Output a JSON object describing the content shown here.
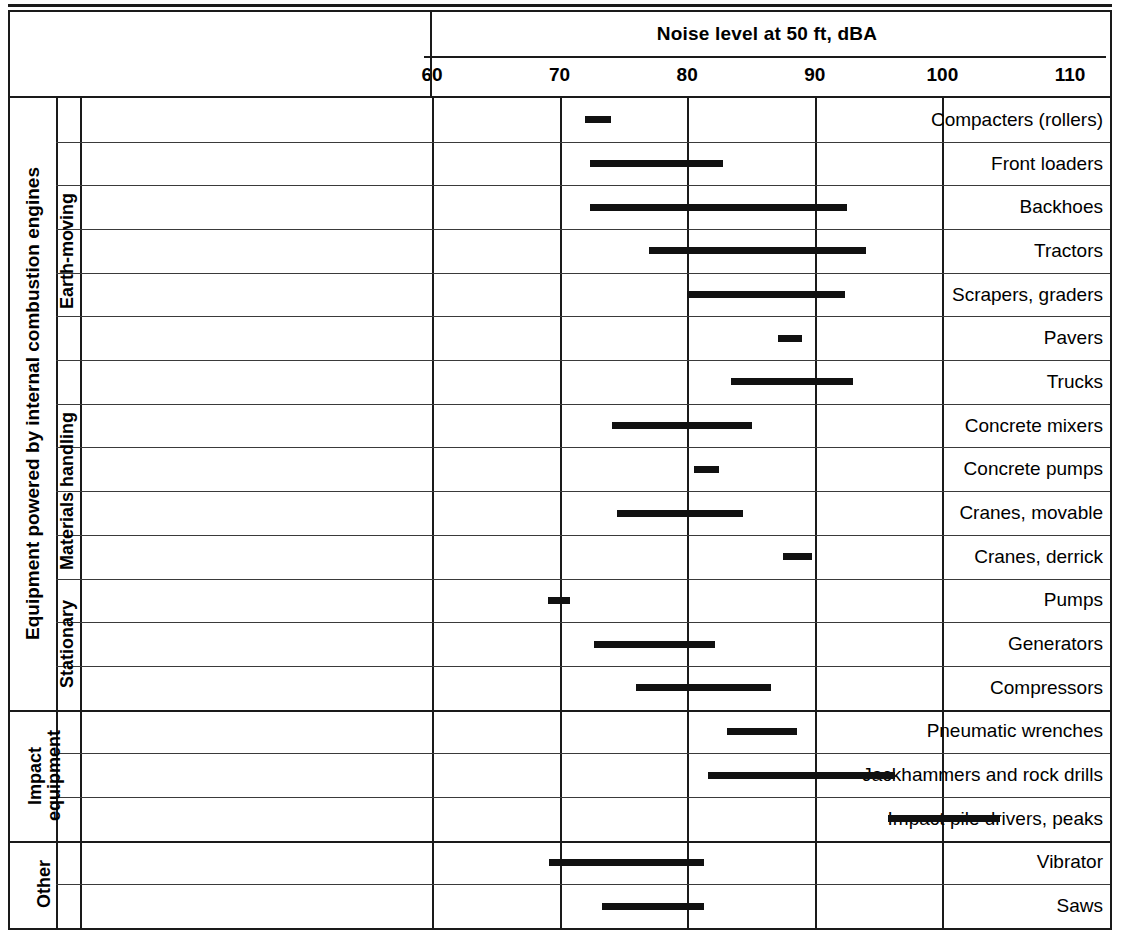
{
  "chart_data": {
    "type": "bar",
    "subtype": "range-bar",
    "title": "Noise level at 50 ft, dBA",
    "xlabel": "Noise level at 50 ft, dBA",
    "ylabel": "",
    "xlim": [
      60,
      110
    ],
    "xticks": [
      60,
      70,
      80,
      90,
      100,
      110
    ],
    "grid": true,
    "legend": "none",
    "categories": [
      "Compacters (rollers)",
      "Front loaders",
      "Backhoes",
      "Tractors",
      "Scrapers, graders",
      "Pavers",
      "Trucks",
      "Concrete mixers",
      "Concrete pumps",
      "Cranes, movable",
      "Cranes, derrick",
      "Pumps",
      "Generators",
      "Compressors",
      "Pneumatic wrenches",
      "Jackhammers and rock drills",
      "Impact pile drivers, peaks",
      "Vibrator",
      "Saws"
    ],
    "ranges": [
      [
        72.0,
        74.0
      ],
      [
        72.4,
        82.8
      ],
      [
        72.4,
        92.5
      ],
      [
        77.0,
        94.0
      ],
      [
        80.0,
        92.4
      ],
      [
        87.1,
        89.0
      ],
      [
        83.4,
        93.0
      ],
      [
        74.1,
        85.1
      ],
      [
        80.5,
        82.5
      ],
      [
        74.5,
        84.4
      ],
      [
        87.5,
        89.8
      ],
      [
        69.1,
        70.8
      ],
      [
        72.7,
        82.2
      ],
      [
        76.0,
        86.6
      ],
      [
        83.1,
        88.6
      ],
      [
        81.6,
        96.3
      ],
      [
        95.7,
        104.5
      ],
      [
        69.2,
        81.3
      ],
      [
        73.3,
        81.3
      ]
    ],
    "groups": [
      {
        "label": "Equipment powered by internal combustion engines",
        "rows": 14
      },
      {
        "label": "Impact equipment",
        "rows": 3
      },
      {
        "label": "Other",
        "rows": 2
      }
    ],
    "subgroups": [
      {
        "label": "Earth-moving",
        "rows": 7
      },
      {
        "label": "Materials handling",
        "rows": 4
      },
      {
        "label": "Stationary",
        "rows": 3
      },
      {
        "label": "Impact equipment",
        "rows": 3
      },
      {
        "label": "Other",
        "rows": 2
      }
    ]
  },
  "header": {
    "title": "Noise level at 50 ft, dBA",
    "ticks": [
      "60",
      "70",
      "80",
      "90",
      "100",
      "110"
    ]
  },
  "groups": {
    "main": "Equipment powered by internal combustion engines",
    "impact": "Impact\nequipment",
    "other": "Other"
  },
  "subgroups": {
    "earth": "Earth-moving",
    "materials": "Materials handling",
    "stationary": "Stationary"
  },
  "rows": [
    {
      "label": "Compacters (rollers)",
      "min": 72.0,
      "max": 74.0
    },
    {
      "label": "Front loaders",
      "min": 72.4,
      "max": 82.8
    },
    {
      "label": "Backhoes",
      "min": 72.4,
      "max": 92.5
    },
    {
      "label": "Tractors",
      "min": 77.0,
      "max": 94.0
    },
    {
      "label": "Scrapers, graders",
      "min": 80.0,
      "max": 92.4
    },
    {
      "label": "Pavers",
      "min": 87.1,
      "max": 89.0
    },
    {
      "label": "Trucks",
      "min": 83.4,
      "max": 93.0
    },
    {
      "label": "Concrete mixers",
      "min": 74.1,
      "max": 85.1
    },
    {
      "label": "Concrete pumps",
      "min": 80.5,
      "max": 82.5
    },
    {
      "label": "Cranes, movable",
      "min": 74.5,
      "max": 84.4
    },
    {
      "label": "Cranes, derrick",
      "min": 87.5,
      "max": 89.8
    },
    {
      "label": "Pumps",
      "min": 69.1,
      "max": 70.8
    },
    {
      "label": "Generators",
      "min": 72.7,
      "max": 82.2
    },
    {
      "label": "Compressors",
      "min": 76.0,
      "max": 86.6
    },
    {
      "label": "Pneumatic wrenches",
      "min": 83.1,
      "max": 88.6
    },
    {
      "label": "Jackhammers and rock drills",
      "min": 81.6,
      "max": 96.3
    },
    {
      "label": "Impact pile drivers, peaks",
      "min": 95.7,
      "max": 104.5
    },
    {
      "label": "Vibrator",
      "min": 69.2,
      "max": 81.3
    },
    {
      "label": "Saws",
      "min": 73.3,
      "max": 81.3
    }
  ],
  "colors": {
    "bar": "#111111",
    "rule": "#1a1a1a",
    "gridline": "#3a3a3a",
    "background": "#ffffff"
  }
}
